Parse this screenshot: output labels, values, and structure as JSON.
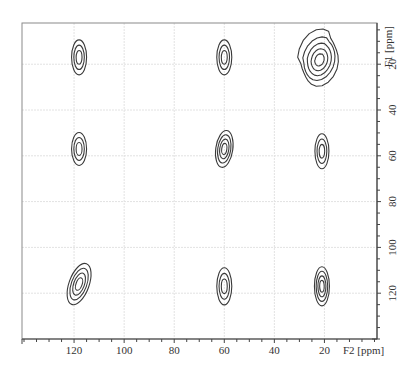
{
  "chart_data": {
    "type": "contour",
    "title": "",
    "xlabel": "F2 [ppm]",
    "ylabel": "F1 [ppm]",
    "xlim": [
      140.8,
      -1
    ],
    "ylim": [
      2,
      140
    ],
    "x_axis_reversed": true,
    "y_axis_position": "right",
    "grid": true,
    "x_ticks": [
      120,
      100,
      80,
      60,
      40,
      20
    ],
    "y_ticks": [
      20,
      40,
      60,
      80,
      100,
      120
    ],
    "x_minor_step": 5,
    "y_minor_step": 5,
    "contour_levels": 4,
    "peaks": [
      {
        "f2": 118,
        "f1": 17,
        "rx": 3.0,
        "ry": 8.5,
        "tilt": 0,
        "levels": 3
      },
      {
        "f2": 60,
        "f1": 17,
        "rx": 3.0,
        "ry": 8.5,
        "tilt": 0,
        "levels": 3
      },
      {
        "f2": 22,
        "f1": 18,
        "rx": 3.6,
        "ry": 13,
        "tilt": 28,
        "levels": 5,
        "shape": "broad"
      },
      {
        "f2": 118,
        "f1": 57,
        "rx": 3.0,
        "ry": 8.0,
        "tilt": 0,
        "levels": 3
      },
      {
        "f2": 60,
        "f1": 57,
        "rx": 3.4,
        "ry": 9.0,
        "tilt": 8,
        "levels": 4
      },
      {
        "f2": 21,
        "f1": 58,
        "rx": 2.8,
        "ry": 8.5,
        "tilt": 0,
        "levels": 3
      },
      {
        "f2": 118,
        "f1": 116,
        "rx": 4.0,
        "ry": 10.5,
        "tilt": 20,
        "levels": 4
      },
      {
        "f2": 60,
        "f1": 117,
        "rx": 3.0,
        "ry": 9.0,
        "tilt": 0,
        "levels": 3
      },
      {
        "f2": 21,
        "f1": 117,
        "rx": 3.0,
        "ry": 9.5,
        "tilt": 0,
        "levels": 4
      }
    ]
  },
  "axes": {
    "x_title": "F2 [ppm]",
    "y_title": "F1 [ppm]"
  },
  "colors": {
    "contour": "#3a3a3a",
    "frame": "#8a8a8a",
    "axis": "#444444",
    "grid": "#e2e2e2"
  }
}
